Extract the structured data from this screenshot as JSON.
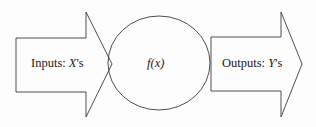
{
  "diagram": {
    "title": "",
    "input_arrow": {
      "prefix": "Inputs: ",
      "variable": "X",
      "suffix": "'s"
    },
    "function_node": {
      "label": "f(x)"
    },
    "output_arrow": {
      "prefix": "Outputs: ",
      "variable": "Y",
      "suffix": "'s"
    },
    "colors": {
      "stroke": "#3a3a3a",
      "text": "#1a1a1a",
      "background": "#fdfdfd"
    }
  }
}
